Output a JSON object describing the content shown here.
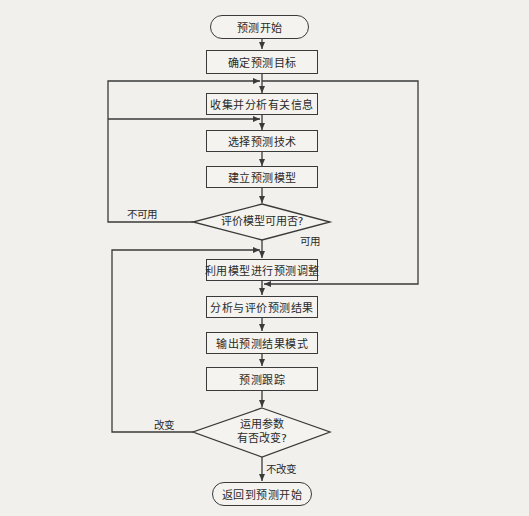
{
  "diagram": {
    "type": "flowchart",
    "nodes": {
      "start": "预测开始",
      "step1": "确定预测目标",
      "step2": "收集并分析有关信息",
      "step3": "选择预测技术",
      "step4": "建立预测模型",
      "decision1": "评价模型可用否?",
      "step5": "利用模型进行预测调整",
      "step6": "分析与评价预测结果",
      "step7": "输出预测结果模式",
      "step8": "预测跟踪",
      "decision2_line1": "运用参数",
      "decision2_line2": "有否改变?",
      "end": "返回到预测开始"
    },
    "edge_labels": {
      "not_usable": "不可用",
      "usable": "可用",
      "changed": "改变",
      "unchanged": "不改变"
    },
    "colors": {
      "stroke": "#3a3a3a",
      "background": "#f1f0ec"
    }
  }
}
